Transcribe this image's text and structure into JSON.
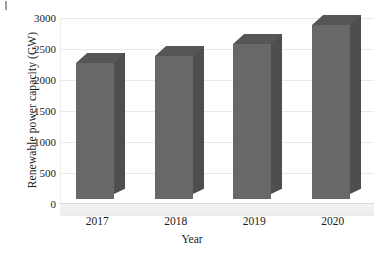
{
  "chart_data": {
    "type": "bar",
    "title": "",
    "subtitle": "",
    "xlabel": "Year",
    "ylabel": "Renewable power capacity (GW)",
    "categories": [
      "2017",
      "2018",
      "2019",
      "2020"
    ],
    "values": [
      2200,
      2300,
      2500,
      2800
    ],
    "series": [
      {
        "name": "Renewable power capacity",
        "values": [
          2200,
          2300,
          2500,
          2800
        ]
      }
    ],
    "ylim": [
      0,
      3000
    ],
    "yticks": [
      "0",
      "500",
      "1000",
      "1500",
      "2000",
      "2500",
      "3000"
    ],
    "ytick_values": [
      0,
      500,
      1000,
      1500,
      2000,
      2500,
      3000
    ],
    "grid": true,
    "legend": false,
    "legend_position": "none",
    "style": "3d-column",
    "bar_color": "#686868",
    "bar_side_color": "#4e4e4e",
    "bar_top_color": "#565656",
    "gridline_color": "#e9e9e9",
    "background_color": "#ffffff",
    "text_color": "#1a1a1a",
    "annotations": []
  }
}
